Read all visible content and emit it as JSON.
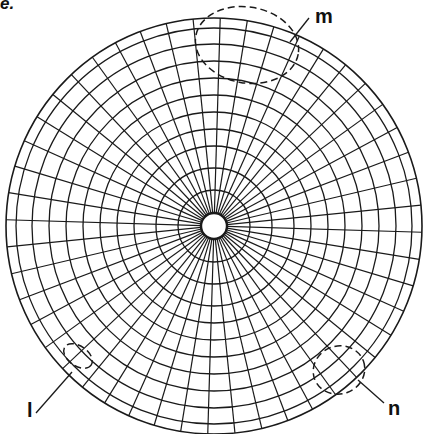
{
  "caption": {
    "fragment": "e."
  },
  "diagram": {
    "type": "orb-web",
    "center": [
      214,
      226
    ],
    "outer_radius": 208,
    "hub_radius": 13,
    "ring_radii": [
      36,
      58,
      80,
      97,
      114,
      131,
      148,
      165,
      182,
      198,
      208
    ],
    "spoke_count": 48,
    "stroke_color": "#1a1a1a"
  },
  "labels": {
    "m": "m",
    "l": "l",
    "n": "n"
  },
  "regions": [
    {
      "id": "m",
      "shape": "ellipse",
      "cx": 247,
      "cy": 45,
      "rx": 52,
      "ry": 38,
      "rotate": 10
    },
    {
      "id": "l",
      "shape": "ellipse",
      "cx": 78,
      "cy": 356,
      "rx": 16,
      "ry": 10,
      "rotate": 35
    },
    {
      "id": "n",
      "shape": "ellipse",
      "cx": 339,
      "cy": 370,
      "rx": 26,
      "ry": 24,
      "rotate": -20
    }
  ]
}
